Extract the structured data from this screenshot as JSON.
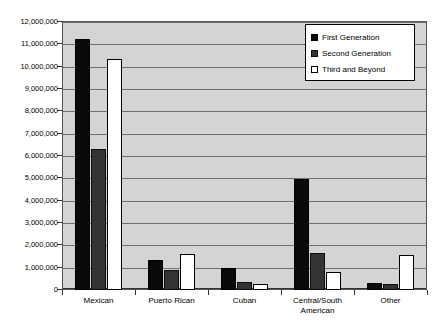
{
  "chart_data": {
    "type": "bar",
    "title": "",
    "subtitle": "",
    "xlabel": "",
    "ylabel": "",
    "grid": true,
    "legend_position": "top-right",
    "ylim": [
      0,
      12000000
    ],
    "ytick_step": 1000000,
    "ytick_labels": [
      "12,000,000",
      "11,000,000",
      "10,000,000",
      "9,000,000",
      "8,000,000",
      "7,000,000",
      "6,000,000",
      "5,000,000",
      "4,000,000",
      "3,000,000",
      "2,000,000",
      "1,000,000",
      "0"
    ],
    "ytick_values": [
      12000000,
      11000000,
      10000000,
      9000000,
      8000000,
      7000000,
      6000000,
      5000000,
      4000000,
      3000000,
      2000000,
      1000000,
      0
    ],
    "categories": [
      "Mexican",
      "Puerto Rican",
      "Cuban",
      "Central/South American",
      "Other"
    ],
    "category_labels": [
      {
        "line1": "Mexican",
        "line2": ""
      },
      {
        "line1": "Puerto Rican",
        "line2": ""
      },
      {
        "line1": "Cuban",
        "line2": ""
      },
      {
        "line1": "Central/South",
        "line2": "American"
      },
      {
        "line1": "Other",
        "line2": ""
      }
    ],
    "series": [
      {
        "name": "First Generation",
        "color": "#0a0a0a",
        "values": [
          11250000,
          1350000,
          1000000,
          4970000,
          300000
        ]
      },
      {
        "name": "Second Generation",
        "color": "#333333",
        "values": [
          6300000,
          900000,
          350000,
          1650000,
          250000
        ]
      },
      {
        "name": "Third and Beyond",
        "color": "#ffffff",
        "values": [
          10350000,
          1600000,
          270000,
          800000,
          1550000
        ]
      }
    ]
  },
  "legend": {
    "items": [
      {
        "label": "First Generation"
      },
      {
        "label": "Second Generation"
      },
      {
        "label": "Third and Beyond"
      }
    ]
  }
}
